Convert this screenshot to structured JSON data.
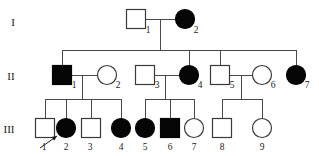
{
  "diagram": {
    "type": "pedigree-chart",
    "width": 319,
    "height": 156,
    "background_color": "#ffffff",
    "line_color": "#4a4a4a",
    "affected_fill_color": "#050505",
    "unaffected_fill_color": "#ffffff",
    "symbol_stroke_color": "#3a3a3a"
  },
  "generation_labels": [
    {
      "text": "I",
      "x": 13,
      "y": 26
    },
    {
      "text": "II",
      "x": 11,
      "y": 80
    },
    {
      "text": "III",
      "x": 9,
      "y": 133
    }
  ],
  "individuals": [
    {
      "id": "I-1",
      "number": "1",
      "generation": "I",
      "sex": "male",
      "shape": "square",
      "affected": false,
      "cx": 136,
      "cy": 19,
      "size": 19,
      "label_x": 148,
      "label_y": 33
    },
    {
      "id": "I-2",
      "number": "2",
      "generation": "I",
      "sex": "female",
      "shape": "circle",
      "affected": true,
      "cx": 185,
      "cy": 19,
      "size": 19,
      "label_x": 196,
      "label_y": 33
    },
    {
      "id": "II-1",
      "number": "1",
      "generation": "II",
      "sex": "male",
      "shape": "square",
      "affected": true,
      "cx": 62,
      "cy": 75,
      "size": 19,
      "label_x": 74,
      "label_y": 88
    },
    {
      "id": "II-2",
      "number": "2",
      "generation": "II",
      "sex": "female",
      "shape": "circle",
      "affected": false,
      "cx": 107,
      "cy": 75,
      "size": 19,
      "label_x": 118,
      "label_y": 88
    },
    {
      "id": "II-3",
      "number": "3",
      "generation": "II",
      "sex": "male",
      "shape": "square",
      "affected": false,
      "cx": 145,
      "cy": 75,
      "size": 19,
      "label_x": 157,
      "label_y": 88
    },
    {
      "id": "II-4",
      "number": "4",
      "generation": "II",
      "sex": "female",
      "shape": "circle",
      "affected": true,
      "cx": 189,
      "cy": 75,
      "size": 19,
      "label_x": 200,
      "label_y": 88
    },
    {
      "id": "II-5",
      "number": "5",
      "generation": "II",
      "sex": "male",
      "shape": "square",
      "affected": false,
      "cx": 220,
      "cy": 75,
      "size": 19,
      "label_x": 232,
      "label_y": 88
    },
    {
      "id": "II-6",
      "number": "6",
      "generation": "II",
      "sex": "female",
      "shape": "circle",
      "affected": false,
      "cx": 262,
      "cy": 75,
      "size": 19,
      "label_x": 273,
      "label_y": 88
    },
    {
      "id": "II-7",
      "number": "7",
      "generation": "II",
      "sex": "female",
      "shape": "circle",
      "affected": true,
      "cx": 296,
      "cy": 75,
      "size": 19,
      "label_x": 307,
      "label_y": 88
    },
    {
      "id": "III-1",
      "number": "1",
      "generation": "III",
      "sex": "male",
      "shape": "square",
      "affected": false,
      "cx": 45,
      "cy": 128,
      "size": 19,
      "label_x": 44,
      "label_y": 150
    },
    {
      "id": "III-2",
      "number": "2",
      "generation": "III",
      "sex": "female",
      "shape": "circle",
      "affected": true,
      "cx": 66,
      "cy": 128,
      "size": 19,
      "label_x": 66,
      "label_y": 150
    },
    {
      "id": "III-3",
      "number": "3",
      "generation": "III",
      "sex": "male",
      "shape": "square",
      "affected": false,
      "cx": 91,
      "cy": 128,
      "size": 19,
      "label_x": 90,
      "label_y": 150
    },
    {
      "id": "III-4",
      "number": "4",
      "generation": "III",
      "sex": "female",
      "shape": "circle",
      "affected": true,
      "cx": 121,
      "cy": 128,
      "size": 19,
      "label_x": 121,
      "label_y": 150
    },
    {
      "id": "III-5",
      "number": "5",
      "generation": "III",
      "sex": "female",
      "shape": "circle",
      "affected": true,
      "cx": 145,
      "cy": 128,
      "size": 19,
      "label_x": 145,
      "label_y": 150
    },
    {
      "id": "III-6",
      "number": "6",
      "generation": "III",
      "sex": "male",
      "shape": "square",
      "affected": true,
      "cx": 170,
      "cy": 128,
      "size": 19,
      "label_x": 170,
      "label_y": 150
    },
    {
      "id": "III-7",
      "number": "7",
      "generation": "III",
      "sex": "female",
      "shape": "circle",
      "affected": false,
      "cx": 194,
      "cy": 128,
      "size": 19,
      "label_x": 194,
      "label_y": 150
    },
    {
      "id": "III-8",
      "number": "8",
      "generation": "III",
      "sex": "male",
      "shape": "square",
      "affected": false,
      "cx": 222,
      "cy": 128,
      "size": 19,
      "label_x": 222,
      "label_y": 150
    },
    {
      "id": "III-9",
      "number": "9",
      "generation": "III",
      "sex": "female",
      "shape": "circle",
      "affected": false,
      "cx": 262,
      "cy": 128,
      "size": 19,
      "label_x": 262,
      "label_y": 150
    }
  ],
  "matings": [
    {
      "id": "mating-I",
      "partners": [
        "I-1",
        "I-2"
      ],
      "y": 19,
      "x1": 146,
      "x2": 175,
      "drop_x": 160,
      "drop_to": 50
    },
    {
      "id": "mating-II-a",
      "partners": [
        "II-1",
        "II-2"
      ],
      "y": 75,
      "x1": 72,
      "x2": 97,
      "drop_x": 82,
      "drop_to": 99
    },
    {
      "id": "mating-II-b",
      "partners": [
        "II-3",
        "II-4"
      ],
      "y": 75,
      "x1": 155,
      "x2": 179,
      "drop_x": 165,
      "drop_to": 99
    },
    {
      "id": "mating-II-c",
      "partners": [
        "II-5",
        "II-6"
      ],
      "y": 75,
      "x1": 230,
      "x2": 252,
      "drop_x": 241,
      "drop_to": 99
    }
  ],
  "sibships": [
    {
      "id": "sibship-gen2",
      "parents": "mating-I",
      "bar_y": 50,
      "bar_x1": 62,
      "bar_x2": 296,
      "children_drops": [
        {
          "child": "II-1",
          "x": 62
        },
        {
          "child": "II-4",
          "x": 189
        },
        {
          "child": "II-5",
          "x": 220
        },
        {
          "child": "II-7",
          "x": 296
        }
      ]
    },
    {
      "id": "sibship-gen3-a",
      "parents": "mating-II-a",
      "bar_y": 99,
      "bar_x1": 45,
      "bar_x2": 121,
      "children_drops": [
        {
          "child": "III-1",
          "x": 45
        },
        {
          "child": "III-2",
          "x": 66
        },
        {
          "child": "III-3",
          "x": 91
        },
        {
          "child": "III-4",
          "x": 121
        }
      ]
    },
    {
      "id": "sibship-gen3-b",
      "parents": "mating-II-b",
      "bar_y": 99,
      "bar_x1": 145,
      "bar_x2": 194,
      "children_drops": [
        {
          "child": "III-5",
          "x": 145
        },
        {
          "child": "III-6",
          "x": 170
        },
        {
          "child": "III-7",
          "x": 194
        }
      ]
    },
    {
      "id": "sibship-gen3-c",
      "parents": "mating-II-c",
      "bar_y": 99,
      "bar_x1": 222,
      "bar_x2": 262,
      "children_drops": [
        {
          "child": "III-8",
          "x": 222
        },
        {
          "child": "III-9",
          "x": 262
        }
      ]
    }
  ],
  "proband_arrow": {
    "points_to": "III-2",
    "x1": 40,
    "y1": 148,
    "x2": 57,
    "y2": 136
  }
}
